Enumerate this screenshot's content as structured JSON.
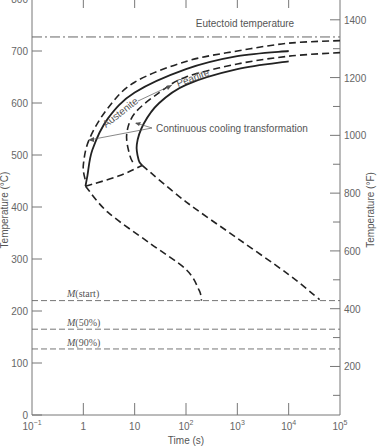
{
  "chart_data": {
    "type": "line",
    "title": "",
    "xlabel": "Time (s)",
    "ylabel": "Temperature (°C)",
    "ylabel_right": "Temperature (°F)",
    "xscale": "log",
    "xlim": [
      0.1,
      100000
    ],
    "ylim": [
      0,
      800
    ],
    "ylim_right_F": [
      32,
      1472
    ],
    "x_ticks": [
      {
        "value": 0.1,
        "label": "10",
        "sup": "−1"
      },
      {
        "value": 1,
        "label": "1",
        "sup": ""
      },
      {
        "value": 10,
        "label": "10",
        "sup": ""
      },
      {
        "value": 100,
        "label": "10",
        "sup": "2"
      },
      {
        "value": 1000,
        "label": "10",
        "sup": "3"
      },
      {
        "value": 10000,
        "label": "10",
        "sup": "4"
      },
      {
        "value": 100000,
        "label": "10",
        "sup": "5"
      }
    ],
    "y_ticks": [
      0,
      100,
      200,
      300,
      400,
      500,
      600,
      700,
      800
    ],
    "y_ticks_right_F": [
      200,
      400,
      600,
      800,
      1000,
      1200,
      1400
    ],
    "y_minor_ticks_right_F": [
      100,
      300,
      500,
      700,
      900,
      1100,
      1300
    ],
    "grid": false,
    "horizontal_lines": [
      {
        "name": "Eutectoid temperature",
        "temperature_C": 727,
        "style": "dash-dot"
      },
      {
        "name": "M(start)",
        "temperature_C": 220,
        "style": "dashed"
      },
      {
        "name": "M(50%)",
        "temperature_C": 165,
        "style": "dashed"
      },
      {
        "name": "M(90%)",
        "temperature_C": 127,
        "style": "dashed"
      }
    ],
    "series": [
      {
        "name": "Isothermal transformation start (dashed, outer)",
        "style": "dashed",
        "points": [
          [
            100000,
            720
          ],
          [
            10000,
            715
          ],
          [
            1000,
            700
          ],
          [
            100,
            680
          ],
          [
            10,
            640
          ],
          [
            3,
            590
          ],
          [
            1.3,
            530
          ],
          [
            1,
            480
          ],
          [
            1.1,
            450
          ]
        ]
      },
      {
        "name": "Continuous cooling transformation start",
        "style": "solid",
        "points": [
          [
            10000,
            700
          ],
          [
            1000,
            690
          ],
          [
            100,
            665
          ],
          [
            10,
            620
          ],
          [
            3,
            570
          ],
          [
            1.5,
            510
          ],
          [
            1.2,
            460
          ],
          [
            1.1,
            440
          ]
        ]
      },
      {
        "name": "Isothermal transformation finish (dashed, inner)",
        "style": "dashed",
        "points": [
          [
            100000,
            697
          ],
          [
            10000,
            690
          ],
          [
            1000,
            675
          ],
          [
            100,
            650
          ],
          [
            30,
            620
          ],
          [
            10,
            580
          ],
          [
            7,
            540
          ],
          [
            8,
            500
          ],
          [
            10,
            480
          ]
        ]
      },
      {
        "name": "Continuous cooling transformation finish",
        "style": "solid",
        "points": [
          [
            10000,
            680
          ],
          [
            1000,
            665
          ],
          [
            100,
            635
          ],
          [
            30,
            600
          ],
          [
            15,
            560
          ],
          [
            11,
            520
          ],
          [
            12,
            490
          ],
          [
            14,
            480
          ]
        ]
      },
      {
        "name": "Lower dashed (to M start, left)",
        "style": "dashed",
        "points": [
          [
            1.1,
            440
          ],
          [
            3,
            390
          ],
          [
            20,
            330
          ],
          [
            100,
            280
          ],
          [
            180,
            240
          ],
          [
            200,
            220
          ]
        ]
      },
      {
        "name": "Lower dashed (to M start, right)",
        "style": "dashed",
        "points": [
          [
            14,
            480
          ],
          [
            100,
            410
          ],
          [
            1000,
            340
          ],
          [
            10000,
            270
          ],
          [
            40000,
            222
          ]
        ]
      },
      {
        "name": "Connector dashed",
        "style": "dashed",
        "points": [
          [
            1.1,
            440
          ],
          [
            5,
            460
          ],
          [
            14,
            480
          ]
        ]
      }
    ],
    "annotations": [
      {
        "text": "Eutectoid temperature"
      },
      {
        "text": "Austenite",
        "arrow_to": "Pearlite"
      },
      {
        "text": "Pearlite"
      },
      {
        "text": "Continuous cooling transformation"
      },
      {
        "text": "M(start)"
      },
      {
        "text": "M(50%)"
      },
      {
        "text": "M(90%)"
      }
    ]
  },
  "labels": {
    "eutectoid": "Eutectoid temperature",
    "austenite": "Austenite",
    "pearlite": "Pearlite",
    "cct": "Continuous cooling transformation",
    "m_start_M": "M",
    "m_start_rest": "(start)",
    "m50_M": "M",
    "m50_rest": "(50%)",
    "m90_M": "M",
    "m90_rest": "(90%)",
    "xlabel": "Time (s)",
    "ylabel": "Temperature (°C)",
    "ylabel_right": "Temperature (°F)"
  }
}
